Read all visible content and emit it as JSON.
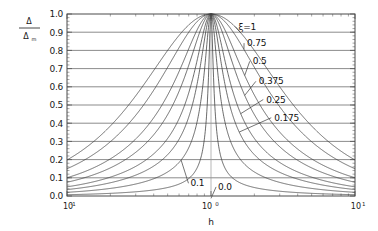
{
  "chart_data": {
    "type": "line",
    "title": "",
    "xlabel": "h",
    "ylabel_numerator": "Δ",
    "ylabel_denominator": "Δ",
    "ylabel_denominator_sub": "m",
    "xscale": "log",
    "xlim": [
      0.1,
      10
    ],
    "ylim": [
      0,
      1
    ],
    "grid": "horizontal-major-and-vertical-at-1",
    "legend_position": "inline-labels-right-of-peak",
    "x_tick_labels": [
      "10-1",
      "100",
      "101"
    ],
    "x_tick_mantissas": [
      "10",
      "10",
      "10"
    ],
    "x_tick_exponents": [
      "-1",
      "0",
      "1"
    ],
    "x_tick_values": [
      0.1,
      1,
      10
    ],
    "y_tick_labels": [
      "0.0",
      "0.1",
      "0.2",
      "0.3",
      "0.4",
      "0.5",
      "0.6",
      "0.7",
      "0.8",
      "0.9",
      "1.0"
    ],
    "y_tick_values": [
      0.0,
      0.1,
      0.2,
      0.3,
      0.4,
      0.5,
      0.6,
      0.7,
      0.8,
      0.9,
      1.0
    ],
    "series": [
      {
        "name": "ξ=1",
        "zeta": 1.0,
        "label": "ξ=1",
        "peak": 1.0
      },
      {
        "name": "0.75",
        "zeta": 0.75,
        "label": "0.75",
        "peak": 1.0
      },
      {
        "name": "0.5",
        "zeta": 0.5,
        "label": "0.5",
        "peak": 1.0
      },
      {
        "name": "0.375",
        "zeta": 0.375,
        "label": "0.375",
        "peak": 1.0
      },
      {
        "name": "0.25",
        "zeta": 0.25,
        "label": "0.25",
        "peak": 1.0
      },
      {
        "name": "0.175",
        "zeta": 0.175,
        "label": "0.175",
        "peak": 1.0
      },
      {
        "name": "0.1",
        "zeta": 0.1,
        "label": "0.1",
        "peak": 1.0
      },
      {
        "name": "0.0",
        "zeta": 0.035,
        "label": "0.0",
        "peak": 1.0
      }
    ],
    "annotations": [
      {
        "text": "ξ=1",
        "x": 1.55,
        "y": 0.93
      },
      {
        "text": "0.75",
        "x": 1.78,
        "y": 0.84
      },
      {
        "text": "0.5",
        "x": 1.95,
        "y": 0.74
      },
      {
        "text": "0.375",
        "x": 2.15,
        "y": 0.63
      },
      {
        "text": "0.25",
        "x": 2.42,
        "y": 0.53
      },
      {
        "text": "0.175",
        "x": 2.75,
        "y": 0.43
      },
      {
        "text": "0.1",
        "x": 0.72,
        "y": 0.07
      },
      {
        "text": "0.0",
        "x": 1.12,
        "y": 0.05
      }
    ]
  },
  "colors": {
    "curve": "#3a3a3a",
    "axis": "#4a4a4a",
    "grid": "#5a5a5a",
    "vgrid": "#9a9a9a",
    "background": "#ffffff",
    "text": "#1a1a1a"
  }
}
